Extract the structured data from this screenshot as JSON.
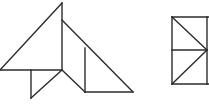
{
  "scene": {
    "title": "Two line-drawn geometric figures",
    "background_color": "#ffffff",
    "stroke_color": "#2b2b2b",
    "stroke_width": 1.4,
    "canvas": {
      "width": 209,
      "height": 105
    }
  },
  "figures": [
    {
      "id": "left-figure",
      "name": "composite-triangle-arrangement",
      "description": "Tangram-like arrangement of four triangles sharing a central vertex",
      "vertices": {
        "apex_top": [
          62,
          3
        ],
        "left_end": [
          0,
          70
        ],
        "center": [
          62,
          70
        ],
        "notch": [
          85,
          27
        ],
        "inner_top": [
          85,
          48
        ],
        "inner_bottom": [
          85,
          92
        ],
        "right_end": [
          133,
          92
        ],
        "small_tri_top": [
          31,
          70
        ],
        "small_tri_bottom": [
          31,
          98
        ],
        "lower_mid": [
          85,
          92
        ]
      },
      "segments": [
        {
          "name": "left-hypotenuse",
          "from": [
            0,
            70
          ],
          "to": [
            62,
            3
          ]
        },
        {
          "name": "center-vertical",
          "from": [
            62,
            3
          ],
          "to": [
            62,
            70
          ]
        },
        {
          "name": "baseline-horizontal",
          "from": [
            0,
            70
          ],
          "to": [
            62,
            70
          ]
        },
        {
          "name": "upper-right-diagonal",
          "from": [
            62,
            20
          ],
          "to": [
            133,
            92
          ]
        },
        {
          "name": "small-triangle-vertical",
          "from": [
            31,
            70
          ],
          "to": [
            31,
            98
          ]
        },
        {
          "name": "small-triangle-diagonal",
          "from": [
            31,
            98
          ],
          "to": [
            62,
            70
          ]
        },
        {
          "name": "lower-diagonal-left",
          "from": [
            62,
            70
          ],
          "to": [
            85,
            92
          ]
        },
        {
          "name": "lower-baseline",
          "from": [
            85,
            92
          ],
          "to": [
            133,
            92
          ]
        },
        {
          "name": "inner-vertical",
          "from": [
            85,
            48
          ],
          "to": [
            85,
            92
          ]
        }
      ]
    },
    {
      "id": "right-figure",
      "name": "rectangle-with-chevron",
      "description": "Rectangle crossed by two diagonals forming a right-pointing arrow, clipped by the image edge",
      "vertices": {
        "top_left": [
          172,
          17
        ],
        "top_right": [
          209,
          17
        ],
        "bottom_left": [
          172,
          84
        ],
        "bottom_right": [
          209,
          84
        ],
        "mid_left": [
          172,
          50
        ],
        "apex_right": [
          207,
          50
        ]
      },
      "segments": [
        {
          "name": "left-vertical",
          "from": [
            172,
            17
          ],
          "to": [
            172,
            84
          ]
        },
        {
          "name": "top-horizontal",
          "from": [
            172,
            17
          ],
          "to": [
            209,
            17
          ]
        },
        {
          "name": "bottom-horizontal",
          "from": [
            172,
            84
          ],
          "to": [
            209,
            84
          ]
        },
        {
          "name": "middle-horizontal",
          "from": [
            172,
            50
          ],
          "to": [
            207,
            50
          ]
        },
        {
          "name": "upper-diagonal",
          "from": [
            172,
            17
          ],
          "to": [
            207,
            50
          ]
        },
        {
          "name": "lower-diagonal",
          "from": [
            207,
            50
          ],
          "to": [
            172,
            84
          ]
        },
        {
          "name": "right-vertical-clip",
          "from": [
            207,
            17
          ],
          "to": [
            207,
            84
          ]
        }
      ]
    }
  ]
}
